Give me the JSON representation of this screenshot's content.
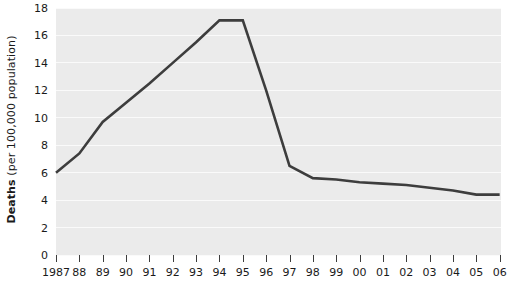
{
  "chart_data": {
    "type": "line",
    "title": "",
    "subtitle": "",
    "xlabel": "",
    "ylabel": "Deaths (per 100,000 population)",
    "ylabel_bold_part": "Deaths",
    "ylabel_rest": " (per 100,000 population)",
    "x": [
      1987,
      1988,
      1989,
      1990,
      1991,
      1992,
      1993,
      1994,
      1995,
      1996,
      1997,
      1998,
      1999,
      2000,
      2001,
      2002,
      2003,
      2004,
      2005,
      2006
    ],
    "xtick_labels": [
      "1987",
      "88",
      "89",
      "90",
      "91",
      "92",
      "93",
      "94",
      "95",
      "96",
      "97",
      "98",
      "99",
      "00",
      "01",
      "02",
      "03",
      "04",
      "05",
      "06"
    ],
    "values": [
      6.0,
      7.4,
      9.7,
      11.1,
      12.5,
      14.0,
      15.5,
      17.1,
      17.1,
      12.0,
      6.5,
      5.6,
      5.5,
      5.3,
      5.2,
      5.1,
      4.9,
      4.7,
      4.4,
      4.4
    ],
    "ytick_labels": [
      "0",
      "2",
      "4",
      "6",
      "8",
      "10",
      "12",
      "14",
      "16",
      "18"
    ],
    "ytick_values": [
      0,
      2,
      4,
      6,
      8,
      10,
      12,
      14,
      16,
      18
    ],
    "ylim": [
      0,
      18
    ],
    "xlim": [
      1987,
      2006
    ],
    "grid": "horizontal-white",
    "legend": "none",
    "line_color": "#3d3d3d",
    "plot_background": "#ebebeb",
    "figure_background": "#ffffff",
    "gridline_color": "#fafafa"
  },
  "caption": {
    "text": ""
  }
}
